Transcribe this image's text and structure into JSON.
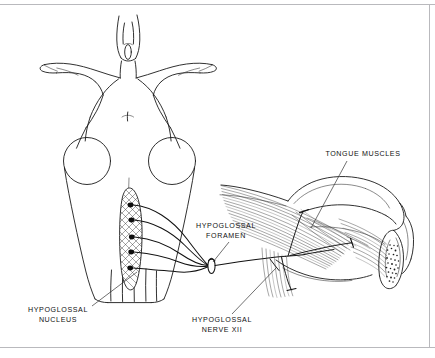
{
  "figure": {
    "width": 435,
    "height": 358,
    "background_color": "#ffffff",
    "ink_color": "#111111",
    "frame_color": "#b9b9bd"
  },
  "labels": [
    {
      "id": "tongue-muscles",
      "text": "TONGUE MUSCLES",
      "x": 363,
      "y": 156,
      "leader": {
        "x1": 347,
        "y1": 161,
        "x2": 311,
        "y2": 228
      }
    },
    {
      "id": "hypoglossal-foramen",
      "line1": "HYPOGLOSSAL",
      "line2": "FORAMEN",
      "x": 226,
      "y": 228,
      "y2": 238,
      "leader": {
        "x1": 229,
        "y1": 242,
        "x2": 213,
        "y2": 262
      }
    },
    {
      "id": "hypoglossal-nucleus",
      "line1": "HYPOGLOSSAL",
      "line2": "NUCLEUS",
      "x": 58,
      "y": 312,
      "y2": 322,
      "leader": {
        "x1": 92,
        "y1": 306,
        "x2": 137,
        "y2": 272
      }
    },
    {
      "id": "hypoglossal-nerve-xii",
      "line1": "HYPOGLOSSAL",
      "line2": "NERVE XII",
      "x": 222,
      "y": 322,
      "y2": 332,
      "leader": {
        "x1": 232,
        "y1": 314,
        "x2": 276,
        "y2": 268
      }
    }
  ],
  "structures": {
    "brainstem": {
      "name": "brainstem-dorsal-view",
      "note": "Dorsal view of brainstem with cerebellar peduncles and medulla"
    },
    "nucleus": {
      "name": "hypoglossal-nucleus",
      "neuron_count": 5,
      "hatched": true
    },
    "foramen": {
      "name": "hypoglossal-foramen",
      "shape": "oval-ring"
    },
    "tongue": {
      "name": "tongue-lateral-view",
      "fiber_count": 46
    },
    "mandible": {
      "name": "mandible-symphysis-cross-section",
      "trabecular_stipple": true
    }
  }
}
